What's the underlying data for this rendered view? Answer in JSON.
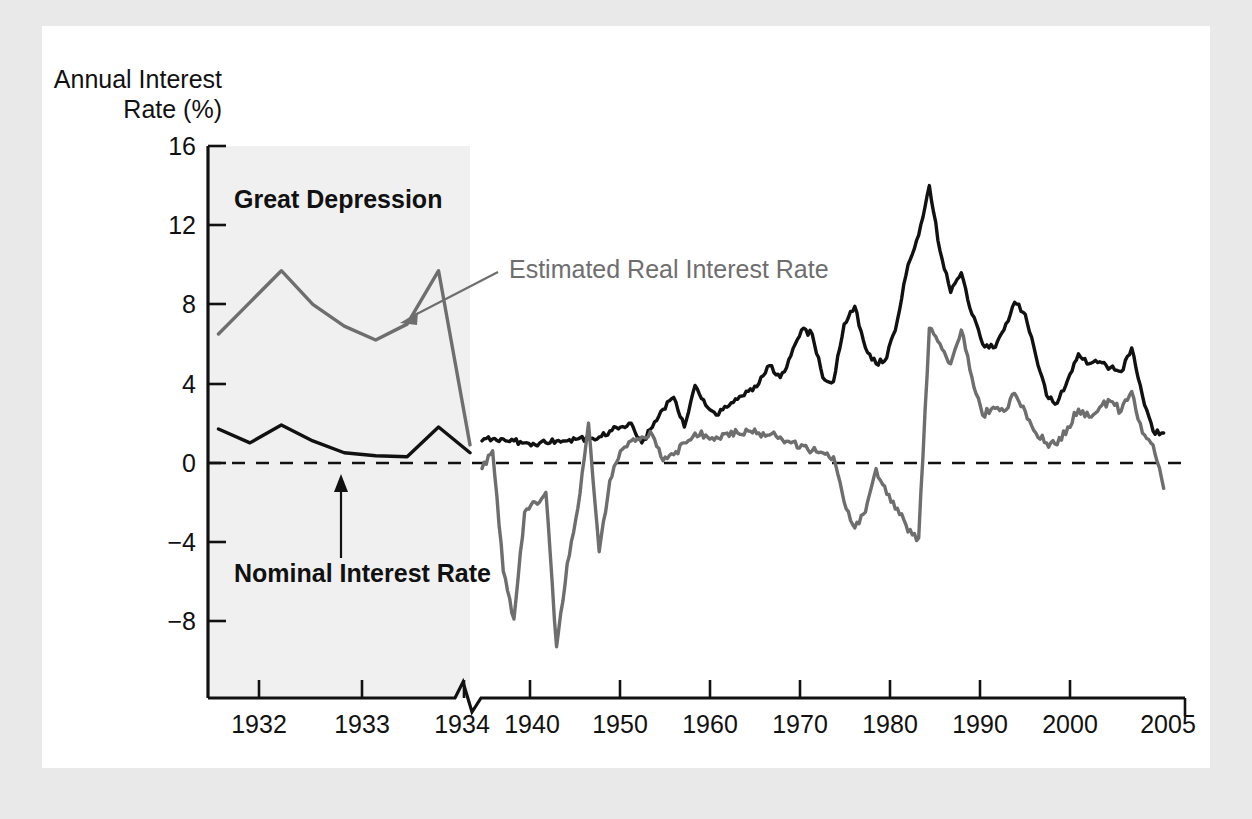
{
  "figure": {
    "background_color": "#e9e9e9",
    "page_color": "#ffffff",
    "nominal_color": "#111111",
    "real_color": "#6e6e6e",
    "band_color": "#f0f0f0"
  },
  "axis": {
    "y_title_line1": "Annual Interest",
    "y_title_line2": "Rate (%)",
    "y_ticks": [
      "16",
      "12",
      "8",
      "4",
      "0",
      "−4",
      "−8"
    ],
    "x_ticks": [
      "1932",
      "1933",
      "1934",
      "1940",
      "1950",
      "1960",
      "1970",
      "1980",
      "1990",
      "2000",
      "2005"
    ]
  },
  "annotations": {
    "great_depression": "Great Depression",
    "real_rate_label": "Estimated Real Interest Rate",
    "nominal_rate_label": "Nominal Interest Rate"
  },
  "chart_data": {
    "type": "line",
    "title": "",
    "subtitle": "",
    "xlabel": "",
    "ylabel": "Annual Interest Rate (%)",
    "ylim": [
      -10.5,
      16
    ],
    "grid": false,
    "legend_position": "inline-annotations",
    "axis_break": {
      "after": 1934.0,
      "before": 1939.0,
      "style": "zigzag"
    },
    "shaded_regions": [
      {
        "label": "Great Depression",
        "x_start": 1931.5,
        "x_end": 1934.0,
        "color": "#f0f0f0"
      }
    ],
    "reference_lines": [
      {
        "y": 0,
        "style": "dashed",
        "color": "#111111"
      }
    ],
    "xtick_values": [
      1932,
      1933,
      1934,
      1940,
      1950,
      1960,
      1970,
      1980,
      1990,
      2000,
      2005
    ],
    "xtick_labels": [
      "1932",
      "1933",
      "1934",
      "1940",
      "1950",
      "1960",
      "1970",
      "1980",
      "1990",
      "2000",
      "2005"
    ],
    "ytick_values": [
      16,
      12,
      8,
      4,
      0,
      -4,
      -8
    ],
    "ytick_labels": [
      "16",
      "12",
      "8",
      "4",
      "0",
      "−4",
      "−8"
    ],
    "series": [
      {
        "name": "Nominal Interest Rate",
        "color": "#111111",
        "style": "solid",
        "segment_depression": {
          "x": [
            1931.6,
            1931.9,
            1932.2,
            1932.5,
            1932.8,
            1933.1,
            1933.4,
            1933.7,
            1934.0
          ],
          "y": [
            1.7,
            1.0,
            1.9,
            1.1,
            0.5,
            0.35,
            0.3,
            1.8,
            0.5
          ]
        },
        "segment_modern": {
          "x": [
            1939.0,
            1940,
            1941,
            1942,
            1943,
            1944,
            1945,
            1946,
            1947,
            1948,
            1949,
            1950,
            1951,
            1952,
            1953,
            1954,
            1955,
            1956,
            1957,
            1958,
            1959,
            1960,
            1961,
            1962,
            1963,
            1964,
            1965,
            1966,
            1967,
            1968,
            1969,
            1970,
            1971,
            1972,
            1973,
            1974,
            1975,
            1976,
            1977,
            1978,
            1979,
            1980,
            1981,
            1982,
            1983,
            1984,
            1985,
            1986,
            1987,
            1988,
            1989,
            1990,
            1991,
            1992,
            1993,
            1994,
            1995,
            1996,
            1997,
            1998,
            1999,
            2000,
            2001,
            2002,
            2003
          ],
          "y": [
            1.1,
            1.2,
            1.2,
            1.1,
            1.0,
            0.9,
            1.0,
            1.1,
            1.1,
            1.2,
            1.2,
            1.3,
            1.6,
            1.8,
            2.0,
            1.0,
            1.8,
            2.7,
            3.3,
            1.8,
            3.9,
            2.9,
            2.4,
            2.8,
            3.2,
            3.6,
            4.0,
            4.9,
            4.3,
            5.4,
            6.7,
            6.5,
            4.3,
            4.1,
            7.0,
            7.9,
            5.8,
            5.0,
            5.3,
            7.2,
            10.0,
            11.5,
            14.0,
            10.7,
            8.6,
            9.6,
            7.5,
            6.0,
            5.8,
            6.7,
            8.1,
            7.5,
            5.4,
            3.4,
            3.0,
            4.2,
            5.5,
            5.0,
            5.1,
            4.8,
            4.6,
            5.8,
            3.4,
            1.6,
            1.5
          ]
        },
        "notes": "Peak near 15.3 in 1981; long-run decline to ~1.5 by 2003"
      },
      {
        "name": "Estimated Real Interest Rate",
        "color": "#6e6e6e",
        "style": "solid",
        "segment_depression": {
          "x": [
            1931.6,
            1931.9,
            1932.2,
            1932.5,
            1932.8,
            1933.1,
            1933.4,
            1933.7,
            1934.0
          ],
          "y": [
            6.5,
            8.1,
            9.7,
            8.0,
            6.9,
            6.2,
            7.0,
            9.7,
            0.9
          ]
        },
        "segment_modern": {
          "x": [
            1939.0,
            1940,
            1941,
            1942,
            1943,
            1944,
            1945,
            1946,
            1947,
            1948,
            1949,
            1950,
            1951,
            1952,
            1953,
            1954,
            1955,
            1956,
            1957,
            1958,
            1959,
            1960,
            1961,
            1962,
            1963,
            1964,
            1965,
            1966,
            1967,
            1968,
            1969,
            1970,
            1971,
            1972,
            1973,
            1974,
            1975,
            1976,
            1977,
            1978,
            1979,
            1980,
            1981,
            1982,
            1983,
            1984,
            1985,
            1986,
            1987,
            1988,
            1989,
            1990,
            1991,
            1992,
            1993,
            1994,
            1995,
            1996,
            1997,
            1998,
            1999,
            2000,
            2001,
            2002,
            2003
          ],
          "y": [
            -0.3,
            0.6,
            -5.5,
            -7.9,
            -2.5,
            -2.0,
            -1.5,
            -9.3,
            -5.1,
            -2.3,
            2.0,
            -4.5,
            -0.9,
            0.6,
            1.1,
            1.3,
            1.4,
            0.1,
            0.4,
            1.0,
            1.5,
            1.4,
            1.3,
            1.5,
            1.5,
            1.6,
            1.5,
            1.4,
            1.3,
            1.0,
            0.9,
            0.6,
            0.5,
            0.3,
            -2.0,
            -3.3,
            -2.5,
            -0.3,
            -1.6,
            -2.3,
            -3.5,
            -3.8,
            6.8,
            6.0,
            5.0,
            6.7,
            4.3,
            2.4,
            2.8,
            2.6,
            3.5,
            2.6,
            1.5,
            1.0,
            0.9,
            1.8,
            2.7,
            2.3,
            2.8,
            3.1,
            2.6,
            3.6,
            1.5,
            0.9,
            -1.3
          ]
        },
        "notes": "Deep negative troughs in the 1940s (min about -9.3); sharp spike above 6 in the early 1980s"
      }
    ]
  }
}
